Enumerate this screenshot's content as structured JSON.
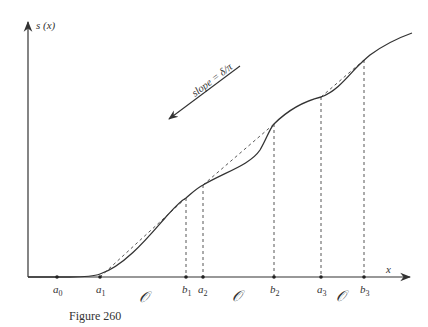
{
  "figure": {
    "caption": "Figure 260",
    "y_axis_label": "s (x)",
    "x_axis_label": "x",
    "slope_annotation": "slope = δ/π",
    "open_set_symbol": "𝒪",
    "points": [
      {
        "name": "a0",
        "base": "a",
        "sub": "0"
      },
      {
        "name": "a1",
        "base": "a",
        "sub": "1"
      },
      {
        "name": "b1",
        "base": "b",
        "sub": "1"
      },
      {
        "name": "a2",
        "base": "a",
        "sub": "2"
      },
      {
        "name": "b2",
        "base": "b",
        "sub": "2"
      },
      {
        "name": "a3",
        "base": "a",
        "sub": "3"
      },
      {
        "name": "b3",
        "base": "b",
        "sub": "3"
      }
    ],
    "open_labels": [
      "𝒪",
      "𝒪",
      "𝒪"
    ]
  }
}
